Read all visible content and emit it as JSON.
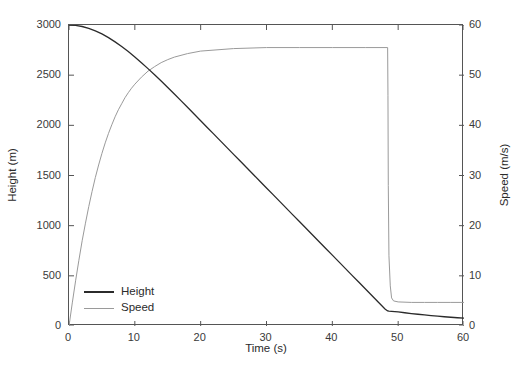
{
  "chart_data": {
    "type": "line",
    "title": "",
    "xlabel": "Time (s)",
    "ylabel": "Height (m)",
    "ylabel_right": "Speed (m/s)",
    "xlim": [
      0,
      60
    ],
    "ylim": [
      0,
      3000
    ],
    "ylim_right": [
      0,
      60
    ],
    "xticks": [
      0,
      10,
      20,
      30,
      40,
      50,
      60
    ],
    "xtick_labels": [
      "0",
      "10",
      "20",
      "30",
      "40",
      "50",
      "60"
    ],
    "yticks": [
      0,
      500,
      1000,
      1500,
      2000,
      2500,
      3000
    ],
    "ytick_labels": [
      "0",
      "500",
      "1000",
      "1500",
      "2000",
      "2500",
      "3000"
    ],
    "yticks_right": [
      0,
      10,
      20,
      30,
      40,
      50,
      60
    ],
    "ytick_labels_right": [
      "0",
      "10",
      "20",
      "30",
      "40",
      "50",
      "60"
    ],
    "grid": false,
    "legend_position": "lower left",
    "legend": [
      "Height",
      "Speed"
    ],
    "colors": {
      "height": "#2b2b2b",
      "speed": "#9a9a9a",
      "axis": "#555555"
    },
    "series": [
      {
        "name": "Height",
        "axis": "left",
        "color": "#2b2b2b",
        "x": [
          0,
          1,
          2,
          3,
          4,
          5,
          6,
          7,
          8,
          9,
          10,
          11,
          12,
          13,
          14,
          15,
          16,
          17,
          18,
          19,
          20,
          21,
          22,
          23,
          24,
          25,
          26,
          27,
          28,
          29,
          30,
          31,
          32,
          33,
          34,
          35,
          36,
          37,
          38,
          39,
          40,
          41,
          42,
          43,
          44,
          45,
          46,
          47,
          48,
          48.4,
          48.6,
          49,
          50,
          51,
          52,
          53,
          54,
          55,
          56,
          57,
          58,
          59,
          60
        ],
        "y": [
          3000,
          2996,
          2985,
          2967,
          2942,
          2911,
          2874,
          2832,
          2786,
          2735,
          2681,
          2624,
          2565,
          2504,
          2441,
          2377,
          2312,
          2246,
          2180,
          2113,
          2046,
          1979,
          1912,
          1845,
          1778,
          1711,
          1644,
          1577,
          1510,
          1443,
          1376,
          1309,
          1242,
          1175,
          1108,
          1041,
          974,
          907,
          840,
          773,
          706,
          639,
          572,
          505,
          438,
          371,
          304,
          237,
          170,
          150,
          148,
          146,
          140,
          132,
          124,
          117,
          110,
          104,
          98,
          92,
          87,
          82,
          78
        ]
      },
      {
        "name": "Speed",
        "axis": "right",
        "color": "#9a9a9a",
        "x": [
          0,
          0.5,
          1,
          1.5,
          2,
          2.5,
          3,
          3.5,
          4,
          4.5,
          5,
          5.5,
          6,
          6.5,
          7,
          7.5,
          8,
          8.5,
          9,
          9.5,
          10,
          11,
          12,
          13,
          14,
          15,
          16,
          18,
          20,
          25,
          30,
          35,
          40,
          45,
          48,
          48.4,
          48.45,
          48.5,
          48.6,
          48.8,
          49,
          49.3,
          50,
          52,
          54,
          56,
          58,
          60
        ],
        "y": [
          0,
          4.6,
          9.0,
          13.1,
          17.0,
          20.5,
          23.8,
          26.8,
          29.6,
          32.1,
          34.4,
          36.5,
          38.4,
          40.1,
          41.7,
          43.1,
          44.3,
          45.5,
          46.5,
          47.4,
          48.2,
          49.6,
          50.8,
          51.7,
          52.5,
          53.1,
          53.6,
          54.3,
          54.8,
          55.3,
          55.5,
          55.5,
          55.5,
          55.5,
          55.5,
          55.5,
          46.0,
          28.0,
          14.0,
          8.0,
          5.6,
          5.0,
          4.8,
          4.7,
          4.7,
          4.7,
          4.7,
          4.7
        ]
      }
    ],
    "annotations": [
      "Height descends from 3000 m to about 170 m by t=48.5 s, then the descent rate drops sharply and height reaches roughly 80 m at t=60 s.",
      "Speed rises asymptotically to a terminal value of about 55.5 m/s, holds the plateau until t=48.5 s, then drops abruptly to about 4.7 m/s."
    ]
  }
}
